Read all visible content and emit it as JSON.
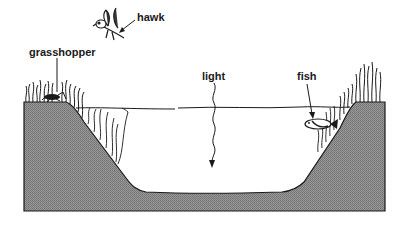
{
  "diagram": {
    "labels": {
      "hawk": "hawk",
      "grasshopper": "grasshopper",
      "light": "light",
      "fish": "fish"
    },
    "colors": {
      "ground": "#8c8c8c",
      "ground_dark": "#6f6f6f",
      "line": "#1a1a1a",
      "water": "#ffffff",
      "background": "#ffffff"
    }
  }
}
